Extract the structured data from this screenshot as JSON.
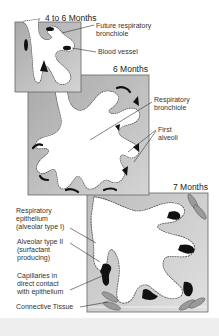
{
  "figure": {
    "panels": [
      {
        "title": "4 to 6 Months",
        "labels": [
          "Future respiratory\nbronchiole",
          "Blood vessel"
        ]
      },
      {
        "title": "6 Months",
        "labels": [
          "Respiratory\nbronchiole",
          "First\nalveoli"
        ]
      },
      {
        "title": "7 Months",
        "labels": [
          "Respiratory\nepithelium\n(alveolar type I)",
          "Alveolar type II\n(surfactant\nproducing)",
          "Capillaries in\ndirect contact\nwith epithelium",
          "Connective Tissue"
        ]
      }
    ],
    "colors": {
      "panel_fill": "#b8b8b8",
      "panel_border": "#666666",
      "lumen": "#ffffff",
      "vessel": "#111111",
      "footer": "#eeeeee"
    }
  }
}
